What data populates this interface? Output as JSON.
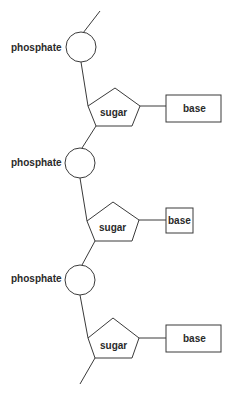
{
  "diagram": {
    "nucleotides": [
      {
        "phosphate_label": "phosphate",
        "sugar_label": "sugar",
        "base_label": "base"
      },
      {
        "phosphate_label": "phosphate",
        "sugar_label": "sugar",
        "base_label": "base"
      },
      {
        "phosphate_label": "phosphate",
        "sugar_label": "sugar",
        "base_label": "base"
      }
    ],
    "colors": {
      "stroke": "#3a3a3a",
      "text": "#2a2a2a",
      "background": "#ffffff"
    }
  }
}
